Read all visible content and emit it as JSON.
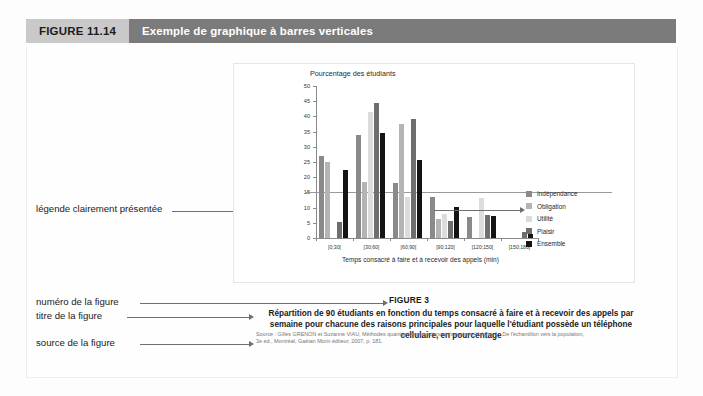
{
  "header": {
    "figure_number": "FIGURE 11.14",
    "figure_title": "Exemple de graphique à barres verticales",
    "num_bg": "#c9c9c9",
    "title_bg": "#7b7b7b"
  },
  "annotations": {
    "legend": "légende clairement présentée",
    "figure_number": "numéro de la figure",
    "figure_title": "titre de la figure",
    "figure_source": "source de la figure"
  },
  "caption": {
    "figure_label": "FIGURE 3",
    "title": "Répartition de 90 étudiants en fonction du temps consacré à faire et à recevoir des appels par semaine pour chacune des raisons principales pour laquelle l'étudiant possède un téléphone cellulaire, en pourcentage",
    "source_line1": "Source : Gilles GRENON et Suzanne VIAU, Méthodes quantitatives en sciences humaines, Volume 1 : De l'échantillon vers la population,",
    "source_line2": "3e éd., Montréal, Gaëtan Morin éditeur, 2007, p. 181."
  },
  "chart_data": {
    "type": "bar",
    "title": "",
    "ylabel": "Pourcentage des étudiants",
    "xlabel": "Temps consacré à faire et à recevoir des appels (min)",
    "categories": [
      "[0;30[",
      "[30;60[",
      "[60;90[",
      "[90;120[",
      "[120;150[",
      "[150;180["
    ],
    "ylim": [
      0,
      50
    ],
    "yticks": [
      0,
      5,
      10,
      15,
      20,
      25,
      30,
      35,
      40,
      45,
      50
    ],
    "grid": false,
    "legend_position": "right",
    "reference_line": 15,
    "series": [
      {
        "name": "Indépendance",
        "color": "#8a8a8a",
        "values": [
          27,
          34,
          18,
          13.5,
          7,
          0
        ]
      },
      {
        "name": "Obligation",
        "color": "#b4b4b4",
        "values": [
          25,
          18.5,
          37.5,
          6.3,
          0,
          0
        ]
      },
      {
        "name": "Utilité",
        "color": "#dcdcdc",
        "values": [
          0,
          41.5,
          13.5,
          8,
          13,
          0
        ]
      },
      {
        "name": "Plaisir",
        "color": "#6e6e6e",
        "values": [
          5.4,
          44.5,
          39,
          5.5,
          7.5,
          2
        ]
      },
      {
        "name": "Ensemble",
        "color": "#141414",
        "values": [
          22.4,
          34.5,
          25.5,
          10.2,
          7.4,
          1.2
        ]
      }
    ]
  }
}
